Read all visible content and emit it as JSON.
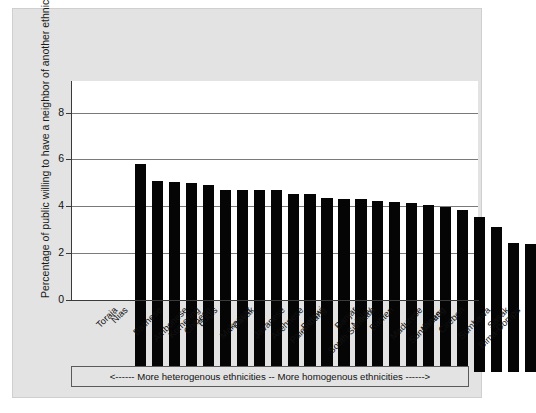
{
  "chart_data": {
    "type": "bar",
    "title": "",
    "subtitle": "",
    "xlabel": "",
    "ylabel": "Percentage of public willing to have a neighbor of another ethnic/religious group",
    "ylim": [
      0,
      9.35
    ],
    "yticks": [
      0,
      2,
      4,
      6,
      8
    ],
    "ytick_labels": [
      "0",
      "2",
      "4",
      "6",
      "8"
    ],
    "grid": true,
    "legend_position": "below-axis",
    "categories": [
      "Toraja",
      "Nias",
      "Balinese",
      "Ambonese",
      "Komering",
      "Chinese",
      "Bugis",
      "Makassar",
      "Dayak",
      "Javanese",
      "Acehnese",
      "Palembang",
      "Betawi",
      "South Sumatra",
      "Banjar",
      "Malay",
      "Banten",
      "Madurese",
      "Sundanese",
      "Minang",
      "Cirebon",
      "Sumbawa",
      "Bima-Dompu",
      "Sasak"
    ],
    "values": [
      8.9,
      8.15,
      8.1,
      8.05,
      8.0,
      7.75,
      7.75,
      7.75,
      7.75,
      7.6,
      7.6,
      7.45,
      7.4,
      7.4,
      7.3,
      7.25,
      7.2,
      7.15,
      7.05,
      6.9,
      6.6,
      6.2,
      5.5,
      5.45
    ],
    "bar_color": "#050505",
    "annotation": "<------ More heterogenous ethnicities  -- More homogenous ethnicities ------>"
  },
  "figure": {
    "panel_background": "#e3e3e3",
    "plot_background": "#ffffff",
    "axis_color": "#3a3a3a",
    "grid_color": "#7a7a7a"
  }
}
